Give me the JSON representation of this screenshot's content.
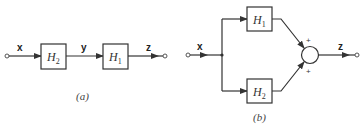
{
  "diagram": {
    "panel_a": {
      "caption": "(a)",
      "input_label": "x",
      "intermediate_label": "y",
      "output_label": "z",
      "blocks": [
        {
          "name": "H",
          "subscript": "2"
        },
        {
          "name": "H",
          "subscript": "1"
        }
      ]
    },
    "panel_b": {
      "caption": "(b)",
      "input_label": "x",
      "output_label": "z",
      "blocks": [
        {
          "name": "H",
          "subscript": "1"
        },
        {
          "name": "H",
          "subscript": "2"
        }
      ],
      "summer_signs": [
        "+",
        "+"
      ]
    },
    "colors": {
      "line": "#333333",
      "background": "#ffffff"
    }
  }
}
